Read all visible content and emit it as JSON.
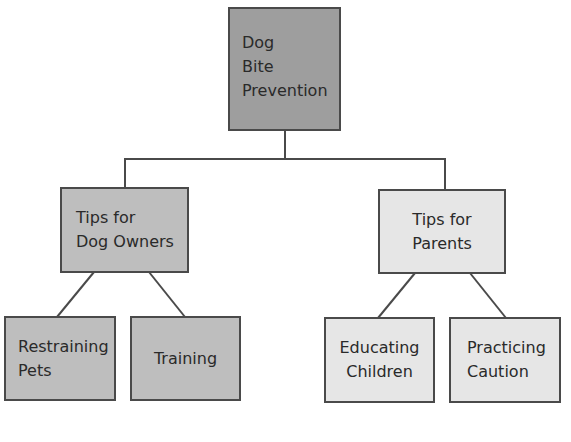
{
  "diagram": {
    "type": "tree",
    "root": {
      "label_lines": [
        "Dog",
        "Bite",
        "Prevention"
      ],
      "fill": "#9e9e9e"
    },
    "branches": [
      {
        "label_lines": [
          "Tips for",
          "Dog Owners"
        ],
        "fill": "#bebebe",
        "children": [
          {
            "label_lines": [
              "Restraining",
              "Pets"
            ],
            "fill": "#bebebe"
          },
          {
            "label_lines": [
              "Training"
            ],
            "fill": "#bebebe"
          }
        ]
      },
      {
        "label_lines": [
          "Tips for",
          "Parents"
        ],
        "fill": "#e6e6e6",
        "children": [
          {
            "label_lines": [
              "Educating",
              "Children"
            ],
            "fill": "#e6e6e6"
          },
          {
            "label_lines": [
              "Practicing",
              "Caution"
            ],
            "fill": "#e6e6e6"
          }
        ]
      }
    ],
    "line_color": "#4a4a4a"
  }
}
